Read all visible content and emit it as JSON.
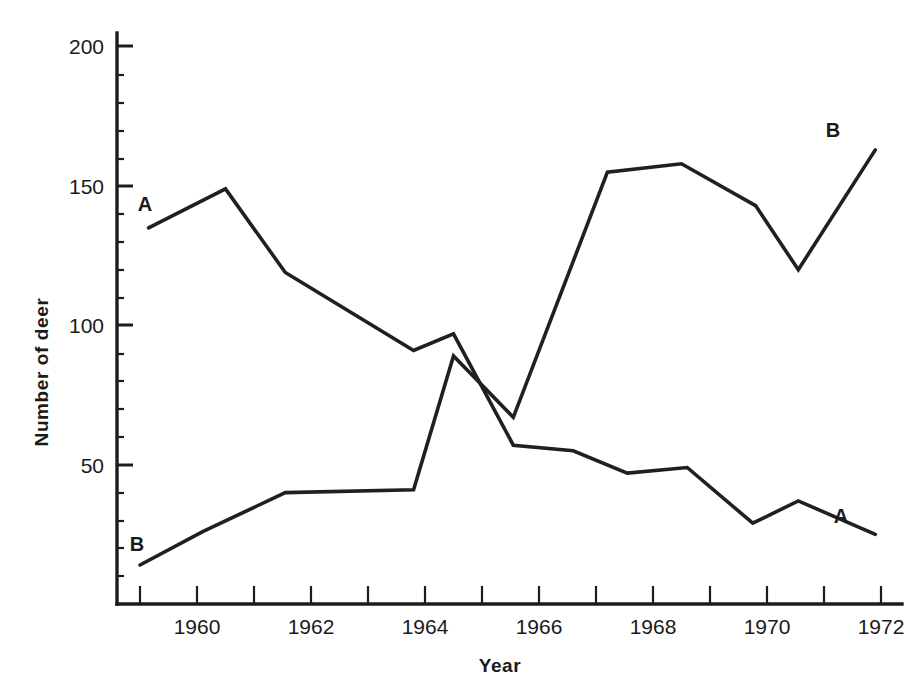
{
  "chart_data": {
    "type": "line",
    "title": "",
    "xlabel": "Year",
    "ylabel": "Number of deer",
    "xlim": [
      1958.6,
      1972.4
    ],
    "ylim": [
      0,
      208
    ],
    "grid": false,
    "legend": "inline-endpoint-labels",
    "x_ticks_all": [
      1959,
      1960,
      1961,
      1962,
      1963,
      1964,
      1965,
      1966,
      1967,
      1968,
      1969,
      1970,
      1971,
      1972
    ],
    "x_tick_labels": [
      "1960",
      "1962",
      "1964",
      "1966",
      "1968",
      "1970",
      "1972"
    ],
    "x_tick_label_values": [
      1960,
      1962,
      1964,
      1966,
      1968,
      1970,
      1972
    ],
    "y_tick_labels": [
      "50",
      "100",
      "150",
      "200"
    ],
    "y_tick_label_values": [
      50,
      100,
      150,
      200
    ],
    "y_minor_ticks": [
      10,
      20,
      30,
      40,
      60,
      70,
      80,
      90,
      110,
      120,
      130,
      140,
      160,
      170,
      180,
      190,
      200
    ],
    "series": [
      {
        "name": "A",
        "label": "A",
        "start_label_position": "left",
        "end_label_position": "right",
        "x": [
          1959.15,
          1960.5,
          1961.55,
          1963.8,
          1964.5,
          1965.55,
          1966.6,
          1967.55,
          1968.6,
          1969.75,
          1970.55,
          1971.9
        ],
        "values": [
          135,
          149,
          119,
          91,
          97,
          57,
          55,
          47,
          49,
          29,
          37,
          25
        ]
      },
      {
        "name": "B",
        "label": "B",
        "start_label_position": "left",
        "end_label_position": "right",
        "x": [
          1959.0,
          1960.1,
          1961.55,
          1963.8,
          1964.5,
          1965.55,
          1967.2,
          1968.5,
          1969.8,
          1970.55,
          1971.9
        ],
        "values": [
          14,
          26,
          40,
          41,
          89,
          67,
          155,
          158,
          143,
          120,
          163
        ]
      }
    ],
    "annotations": [
      {
        "text": "A",
        "series": "A",
        "at_x": 1959.15,
        "at_y": 135,
        "placement": "upper-left"
      },
      {
        "text": "B",
        "series": "B",
        "at_x": 1959.0,
        "at_y": 14,
        "placement": "upper-left"
      },
      {
        "text": "A",
        "series": "A",
        "at_x": 1971.9,
        "at_y": 25,
        "placement": "upper-right"
      },
      {
        "text": "B",
        "series": "B",
        "at_x": 1971.9,
        "at_y": 163,
        "placement": "upper-right"
      }
    ],
    "colors": {
      "line": "#231f20",
      "axis": "#1c1c1c",
      "text": "#1a1a1a",
      "background": "#ffffff"
    }
  }
}
